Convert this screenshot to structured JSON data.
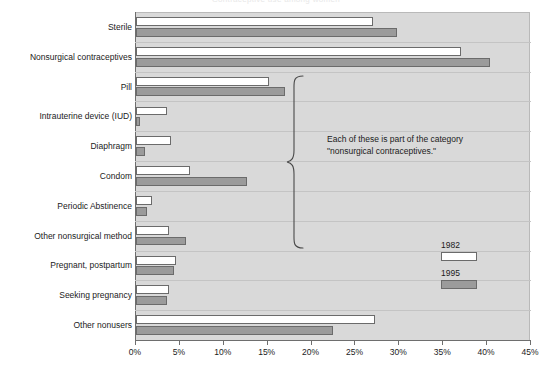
{
  "chart_data": {
    "type": "bar",
    "title": "Contraceptive use among women",
    "orientation": "horizontal",
    "xlabel": "",
    "ylabel": "",
    "xlim": [
      0,
      45
    ],
    "xticks": [
      "0%",
      "5%",
      "10%",
      "15%",
      "20%",
      "25%",
      "30%",
      "35%",
      "40%",
      "45%"
    ],
    "xtick_values": [
      0,
      5,
      10,
      15,
      20,
      25,
      30,
      35,
      40,
      45
    ],
    "grid": false,
    "legend_position": "right",
    "categories": [
      "Sterile",
      "Nonsurgical contraceptives",
      "Pill",
      "Intrauterine device (IUD)",
      "Diaphragm",
      "Condom",
      "Periodic Abstinence",
      "Other nonsurgical method",
      "Pregnant, postpartum",
      "Seeking pregnancy",
      "Other nonusers"
    ],
    "series": [
      {
        "name": "1982",
        "color": "#ffffff",
        "values": [
          27.0,
          37.0,
          15.2,
          3.5,
          4.0,
          6.2,
          1.8,
          3.8,
          4.6,
          3.8,
          27.2
        ]
      },
      {
        "name": "1995",
        "color": "#9b9b9b",
        "values": [
          29.7,
          40.3,
          17.0,
          0.5,
          1.0,
          12.7,
          1.2,
          5.7,
          4.3,
          3.5,
          22.4
        ]
      }
    ],
    "annotations": [
      {
        "name": "nonsurgical-contraceptives-brace-note",
        "text": "Each of these is part of the category \"nonsurgical contraceptives.\"",
        "spans_categories": [
          "Pill",
          "Intrauterine device (IUD)",
          "Diaphragm",
          "Condom",
          "Periodic Abstinence",
          "Other nonsurgical method"
        ]
      }
    ]
  },
  "legend": {
    "entries": [
      {
        "label": "1982",
        "color": "#ffffff"
      },
      {
        "label": "1995",
        "color": "#9b9b9b"
      }
    ]
  },
  "colors": {
    "plot_background": "#d9d9d9",
    "axis": "#6e6e6e",
    "bar_outline": "#6b6b6b",
    "text": "#1b1b1b",
    "series_1982": "#ffffff",
    "series_1995": "#9b9b9b"
  }
}
